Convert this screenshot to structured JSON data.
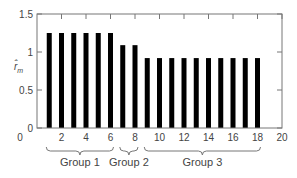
{
  "chart_data": {
    "type": "bar",
    "title": "",
    "xlabel": "",
    "ylabel": "r̂_m",
    "ylabel_main": "r̂",
    "ylabel_sub": "m",
    "xlim": [
      0,
      20
    ],
    "ylim": [
      0,
      1.5
    ],
    "x_ticks": [
      2,
      4,
      6,
      8,
      10,
      12,
      14,
      16,
      18,
      20
    ],
    "x_tick_labels": [
      "0",
      "2",
      "4",
      "6",
      "8",
      "10",
      "12",
      "14",
      "16",
      "18",
      "20"
    ],
    "y_ticks": [
      0,
      0.5,
      1,
      1.5
    ],
    "y_tick_labels": [
      "0",
      "0.5",
      "1",
      "1.5"
    ],
    "grid": false,
    "x": [
      1,
      2,
      3,
      4,
      5,
      6,
      7,
      8,
      9,
      10,
      11,
      12,
      13,
      14,
      15,
      16,
      17,
      18
    ],
    "values": [
      1.25,
      1.25,
      1.25,
      1.25,
      1.25,
      1.25,
      1.09,
      1.09,
      0.92,
      0.92,
      0.92,
      0.92,
      0.92,
      0.92,
      0.92,
      0.92,
      0.92,
      0.92
    ],
    "bar_color": "#000000",
    "annotations": [
      {
        "label": "Group 1",
        "from": 1,
        "to": 6
      },
      {
        "label": "Group 2",
        "from": 7,
        "to": 8
      },
      {
        "label": "Group 3",
        "from": 9,
        "to": 18
      }
    ]
  }
}
